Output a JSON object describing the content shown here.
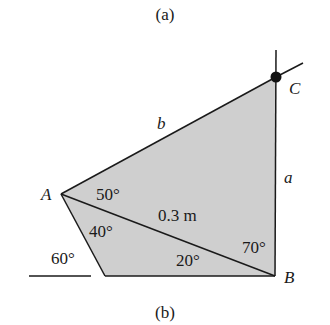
{
  "figure": {
    "caption_top": "(a)",
    "caption_bottom": "(b)",
    "fill_color": "#cfcfcf",
    "line_color": "#1a1a1a",
    "points": {
      "A": {
        "label": "A",
        "x": 61,
        "y": 194
      },
      "B": {
        "label": "B",
        "x": 275,
        "y": 276
      },
      "C": {
        "label": "C",
        "x": 276,
        "y": 77
      },
      "D": {
        "x": 105,
        "y": 276
      }
    },
    "sides": {
      "a": "a",
      "b": "b",
      "AB": "0.3 m"
    },
    "angles": {
      "CAB": "50°",
      "BAD": "40°",
      "ground": "60°",
      "ABD": "20°",
      "ABC": "70°"
    }
  }
}
